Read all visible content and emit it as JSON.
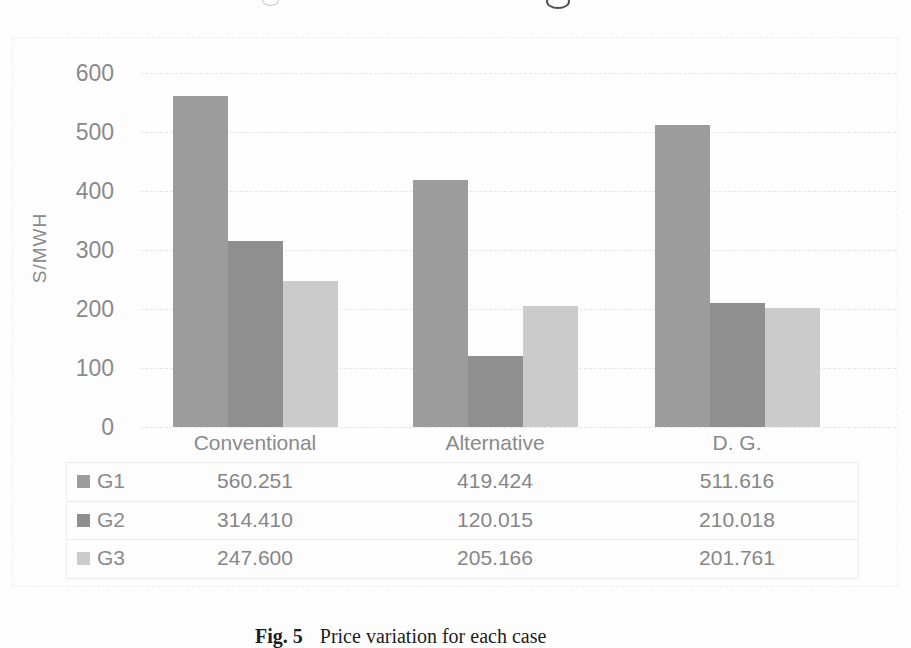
{
  "chart_data": {
    "type": "bar",
    "title": "",
    "xlabel": "",
    "ylabel": "S/MWH",
    "categories": [
      "Conventional",
      "Alternative",
      "D. G."
    ],
    "series": [
      {
        "name": "G1",
        "color": "#9c9c9c",
        "values": [
          560.251,
          419.424,
          511.616
        ]
      },
      {
        "name": "G2",
        "color": "#8f8f8f",
        "values": [
          314.41,
          120.015,
          210.018
        ]
      },
      {
        "name": "G3",
        "color": "#cbcbcb",
        "values": [
          247.6,
          205.166,
          201.761
        ]
      }
    ],
    "y_ticks": [
      0,
      100,
      200,
      300,
      400,
      500,
      600
    ],
    "ylim": [
      0,
      600
    ],
    "grid": true,
    "data_table": true,
    "value_decimals": 3,
    "legend_position": "left-of-data-table"
  },
  "caption": {
    "label": "Fig. 5",
    "text": "Price variation for each case"
  }
}
